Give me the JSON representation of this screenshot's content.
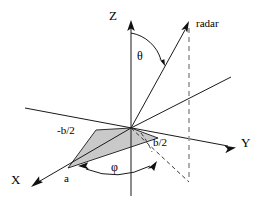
{
  "figure": {
    "background_color": "#ffffff",
    "line_color": "#1a1a1a",
    "shade_color": "#c9c9c9",
    "dashed_gray_color": "#9a9a9a",
    "width": 259,
    "height": 203
  },
  "axes": [
    {
      "id": "x",
      "label": "X"
    },
    {
      "id": "y",
      "label": "Y"
    },
    {
      "id": "z",
      "label": "Z"
    }
  ],
  "rays": [
    {
      "id": "radar",
      "label": "radar"
    }
  ],
  "angles": [
    {
      "id": "theta",
      "label": "θ"
    },
    {
      "id": "phi",
      "label": "φ"
    }
  ],
  "dimensions": [
    {
      "id": "neg-half-b",
      "label": "-b/2"
    },
    {
      "id": "half-b",
      "label": "b/2"
    }
  ],
  "points": [
    {
      "id": "a",
      "label": "a"
    }
  ]
}
